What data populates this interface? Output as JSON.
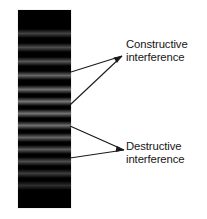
{
  "figure": {
    "background_color": "#ffffff",
    "text_color": "#161616",
    "line_color": "#1a1a1a"
  },
  "pattern": {
    "name": "interference-fringe-block",
    "base_color": "#000000",
    "bright_fringe_color": "#6e6e6e",
    "x": 18,
    "y": 10,
    "width": 53,
    "height": 198,
    "bright_fringe_count": 13,
    "bright_fringe_centers": [
      33,
      47,
      61,
      75,
      89,
      101,
      113,
      125,
      137,
      149,
      161,
      173,
      185
    ],
    "bright_fringe_peaks": [
      0.26,
      0.3,
      0.34,
      0.4,
      0.44,
      0.46,
      0.45,
      0.43,
      0.4,
      0.36,
      0.3,
      0.24,
      0.18
    ],
    "fringe_thickness": 9
  },
  "annotations": [
    {
      "id": "constructive",
      "line1": "Constructive",
      "line2": "interference",
      "label_x": 126,
      "label_y": 38,
      "apex_x": 122,
      "apex_y": 56,
      "targets": [
        {
          "x": 71,
          "y": 72
        },
        {
          "x": 70,
          "y": 105
        }
      ]
    },
    {
      "id": "destructive",
      "line1": "Destructive",
      "line2": "interference",
      "label_x": 126,
      "label_y": 140,
      "apex_x": 124,
      "apex_y": 150,
      "targets": [
        {
          "x": 70,
          "y": 126
        },
        {
          "x": 70,
          "y": 158
        }
      ]
    }
  ]
}
